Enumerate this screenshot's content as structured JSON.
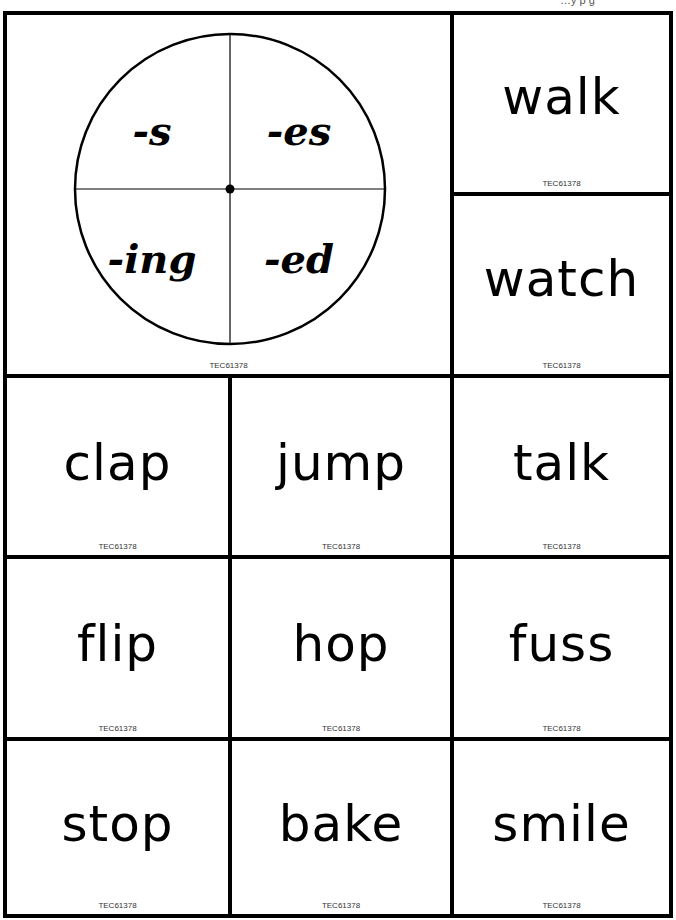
{
  "header": {
    "fragment": "…y  p  g"
  },
  "spinner": {
    "suffixes": [
      "-s",
      "-es",
      "-ing",
      "-ed"
    ],
    "code": "TEC61378"
  },
  "cards": [
    {
      "word": "walk",
      "code": "TEC61378"
    },
    {
      "word": "watch",
      "code": "TEC61378"
    },
    {
      "word": "clap",
      "code": "TEC61378"
    },
    {
      "word": "jump",
      "code": "TEC61378"
    },
    {
      "word": "talk",
      "code": "TEC61378"
    },
    {
      "word": "flip",
      "code": "TEC61378"
    },
    {
      "word": "hop",
      "code": "TEC61378"
    },
    {
      "word": "fuss",
      "code": "TEC61378"
    },
    {
      "word": "stop",
      "code": "TEC61378"
    },
    {
      "word": "bake",
      "code": "TEC61378"
    },
    {
      "word": "smile",
      "code": "TEC61378"
    }
  ],
  "colors": {
    "line": "#000000",
    "background": "#ffffff",
    "code_text": "#333333"
  }
}
